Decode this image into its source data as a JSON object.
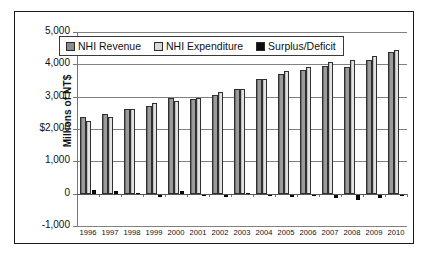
{
  "chart_data": {
    "type": "bar",
    "title": "",
    "xlabel": "",
    "ylabel": "Millions of NT$",
    "ylim": [
      -1000,
      5000
    ],
    "ytick_labels": [
      "5,000",
      "4,000",
      "3,000",
      "$2,000",
      "1,000",
      "0",
      "-1,000"
    ],
    "ytick_values": [
      5000,
      4000,
      3000,
      2000,
      1000,
      0,
      -1000
    ],
    "grid": true,
    "legend_position": "top-left-inside",
    "categories": [
      "1996",
      "1997",
      "1998",
      "1999",
      "2000",
      "2001",
      "2002",
      "2003",
      "2004",
      "2005",
      "2006",
      "2007",
      "2008",
      "2009",
      "2010"
    ],
    "series": [
      {
        "name": "NHI Revenue",
        "color": "#8c8c8c",
        "values": [
          2360,
          2450,
          2630,
          2700,
          2950,
          2930,
          3040,
          3240,
          3540,
          3700,
          3830,
          3950,
          3920,
          4130,
          4380
        ]
      },
      {
        "name": "NHI Expenditure",
        "color": "#d8d8d8",
        "values": [
          2250,
          2380,
          2610,
          2810,
          2880,
          2950,
          3130,
          3230,
          3560,
          3790,
          3910,
          4080,
          4130,
          4250,
          4450
        ]
      },
      {
        "name": "Surplus/Deficit",
        "color": "#0d0d0d",
        "values": [
          110,
          70,
          20,
          -110,
          70,
          -20,
          -90,
          10,
          -20,
          -90,
          -80,
          -130,
          -210,
          -120,
          -70
        ]
      }
    ]
  },
  "legend": {
    "items": [
      {
        "label": "NHI Revenue",
        "color": "#8c8c8c"
      },
      {
        "label": "NHI Expenditure",
        "color": "#d8d8d8"
      },
      {
        "label": "Surplus/Deficit",
        "color": "#0d0d0d"
      }
    ]
  }
}
